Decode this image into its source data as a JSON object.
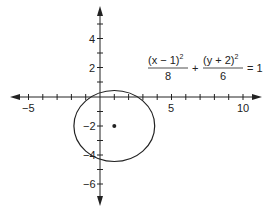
{
  "diagram": {
    "type": "ellipse-graph",
    "equation": {
      "term1_numerator": "(x − 1)",
      "term1_exp": "2",
      "term1_denominator": "8",
      "plus": "+",
      "term2_numerator": "(y + 2)",
      "term2_exp": "2",
      "term2_denominator": "6",
      "equals": "= 1"
    },
    "x_axis": {
      "tick_labels": [
        "−5",
        "5",
        "10"
      ],
      "range": [
        -6,
        11
      ]
    },
    "y_axis": {
      "tick_labels": [
        "4",
        "2",
        "−2",
        "−4",
        "−6"
      ],
      "range": [
        -7,
        6
      ]
    },
    "center_point": {
      "x": 1,
      "y": -2
    },
    "semi_axes": {
      "horizontal": "√8",
      "vertical": "√6"
    },
    "colors": {
      "stroke": "#222222",
      "background": "#ffffff"
    }
  }
}
